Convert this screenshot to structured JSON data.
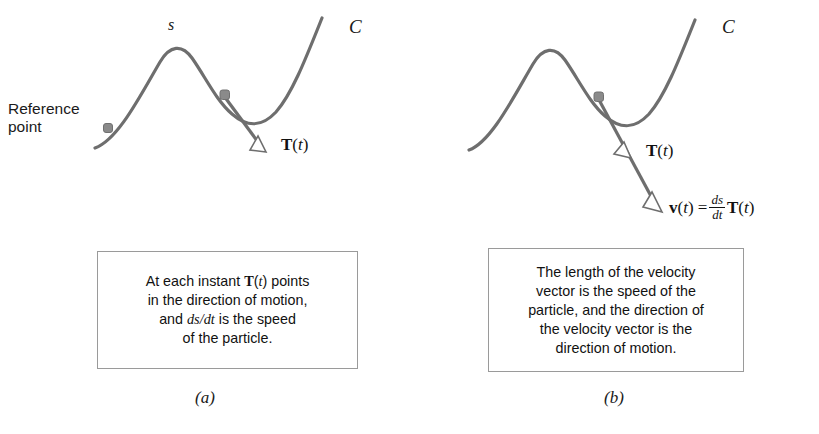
{
  "figure": {
    "type": "diagram",
    "stroke_color": "#6e6e6e",
    "text_color": "#111111",
    "box_border_color": "#9a9a9a",
    "background": "#ffffff"
  },
  "panel_a": {
    "caption": "(a)",
    "curve_label": "C",
    "arclength_label": "s",
    "reference_label_line1": "Reference",
    "reference_label_line2": "point",
    "tangent_vector": {
      "bold": "T",
      "open_paren": "(",
      "var": "t",
      "close_paren": ")"
    },
    "callout": {
      "line1_part1": "At each instant ",
      "line1_bold": "T",
      "line1_paren_open": "(",
      "line1_var": "t",
      "line1_paren_close": ")",
      "line1_part2": " points",
      "line2": "in the direction of motion,",
      "line3_part1": "and ",
      "line3_math": "ds/dt",
      "line3_part2": " is the speed",
      "line4": "of the particle."
    }
  },
  "panel_b": {
    "caption": "(b)",
    "curve_label": "C",
    "tangent_vector": {
      "bold": "T",
      "open_paren": "(",
      "var": "t",
      "close_paren": ")"
    },
    "velocity_vector": {
      "bold": "v",
      "open_paren": "(",
      "var": "t",
      "close_paren": ")",
      "equals": "=",
      "frac_num": "ds",
      "frac_den": "dt",
      "bold2": "T",
      "open_paren2": "(",
      "var2": "t",
      "close_paren2": ")"
    },
    "callout": {
      "line1": "The length of the velocity",
      "line2": "vector is the speed of the",
      "line3": "particle, and the direction of",
      "line4": "the velocity vector is the",
      "line5": "direction of motion."
    }
  }
}
